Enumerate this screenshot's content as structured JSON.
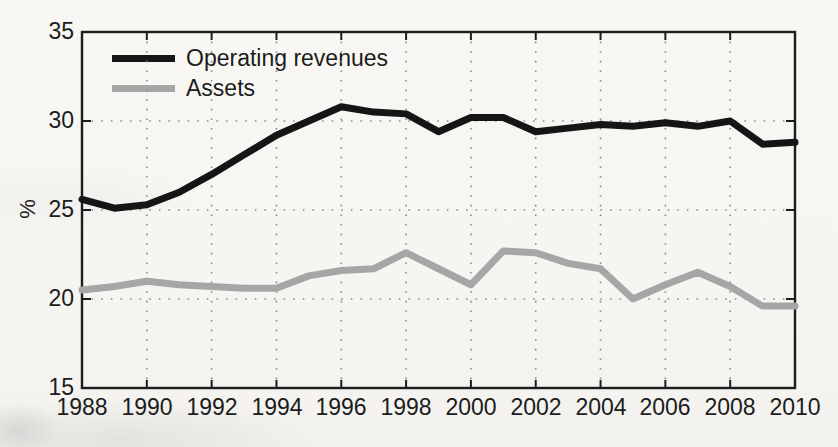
{
  "figure": {
    "background_color": "#f7f6f3",
    "axis_color": "#1c1c1c",
    "grid_color": "#8a8a8a",
    "ylabel": "%"
  },
  "legend": {
    "position": "inside top-left",
    "boxed": false,
    "entries": [
      {
        "label": "Operating revenues",
        "color": "#151515",
        "swatch": "line-swatch-black"
      },
      {
        "label": "Assets",
        "color": "#a6a6a6",
        "swatch": "line-swatch-gray"
      }
    ]
  },
  "axes": {
    "y": {
      "label": "%",
      "min": 15,
      "max": 35,
      "tick_step": 5,
      "ticks": [
        15,
        20,
        25,
        30,
        35
      ],
      "tick_labels": [
        "15",
        "20",
        "25",
        "30",
        "35"
      ]
    },
    "x": {
      "label": "",
      "min": 1988,
      "max": 2010,
      "tick_step": 2,
      "ticks": [
        1988,
        1990,
        1992,
        1994,
        1996,
        1998,
        2000,
        2002,
        2004,
        2006,
        2008,
        2010
      ],
      "tick_labels": [
        "1988",
        "1990",
        "1992",
        "1994",
        "1996",
        "1998",
        "2000",
        "2002",
        "2004",
        "2006",
        "2008",
        "2010"
      ]
    }
  },
  "chart_data": {
    "type": "line",
    "title": "",
    "subtitle": "",
    "xlabel": "",
    "ylabel": "%",
    "grid": "dotted both axes",
    "legend_position": "top-left inside",
    "xlim": [
      1988,
      2010
    ],
    "ylim": [
      15,
      35
    ],
    "x": [
      1988,
      1989,
      1990,
      1991,
      1992,
      1993,
      1994,
      1995,
      1996,
      1997,
      1998,
      1999,
      2000,
      2001,
      2002,
      2003,
      2004,
      2005,
      2006,
      2007,
      2008,
      2009,
      2010
    ],
    "series": [
      {
        "name": "Operating revenues",
        "color": "#151515",
        "line_width_px": 7,
        "values": [
          25.6,
          25.1,
          25.3,
          26.0,
          27.0,
          28.1,
          29.2,
          30.0,
          30.8,
          30.5,
          30.4,
          29.4,
          30.2,
          30.2,
          29.4,
          29.6,
          29.8,
          29.7,
          29.9,
          29.7,
          30.0,
          28.7,
          28.8
        ]
      },
      {
        "name": "Assets",
        "color": "#a6a6a6",
        "line_width_px": 7,
        "values": [
          20.5,
          20.7,
          21.0,
          20.8,
          20.7,
          20.6,
          20.6,
          21.3,
          21.6,
          21.7,
          22.6,
          21.7,
          20.8,
          22.7,
          22.6,
          22.0,
          21.7,
          20.0,
          20.8,
          21.5,
          20.7,
          19.6,
          19.6
        ]
      }
    ]
  },
  "plot_geometry": {
    "left_px": 82,
    "right_px": 795,
    "top_px": 32,
    "bottom_px": 388
  }
}
